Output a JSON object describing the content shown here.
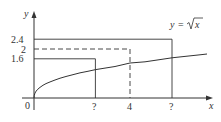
{
  "figure": {
    "function_label": "y = √x",
    "function_lhs": "y",
    "function_eq": "=",
    "function_rhs": "x",
    "axis_x_label": "x",
    "axis_y_label": "y",
    "origin_label": "0",
    "y_ticks": [
      {
        "label": "2.4",
        "value": 2.4,
        "line": "solid"
      },
      {
        "label": "2",
        "value": 2,
        "line": "dashed"
      },
      {
        "label": "1.6",
        "value": 1.6,
        "line": "solid"
      }
    ],
    "x_ticks": [
      {
        "label": "?",
        "value": 2.56,
        "line": "solid"
      },
      {
        "label": "4",
        "value": 4,
        "line": "dashed"
      },
      {
        "label": "?",
        "value": 5.76,
        "line": "solid"
      }
    ],
    "colors": {
      "stroke": "#333333",
      "background": "#ffffff"
    }
  }
}
